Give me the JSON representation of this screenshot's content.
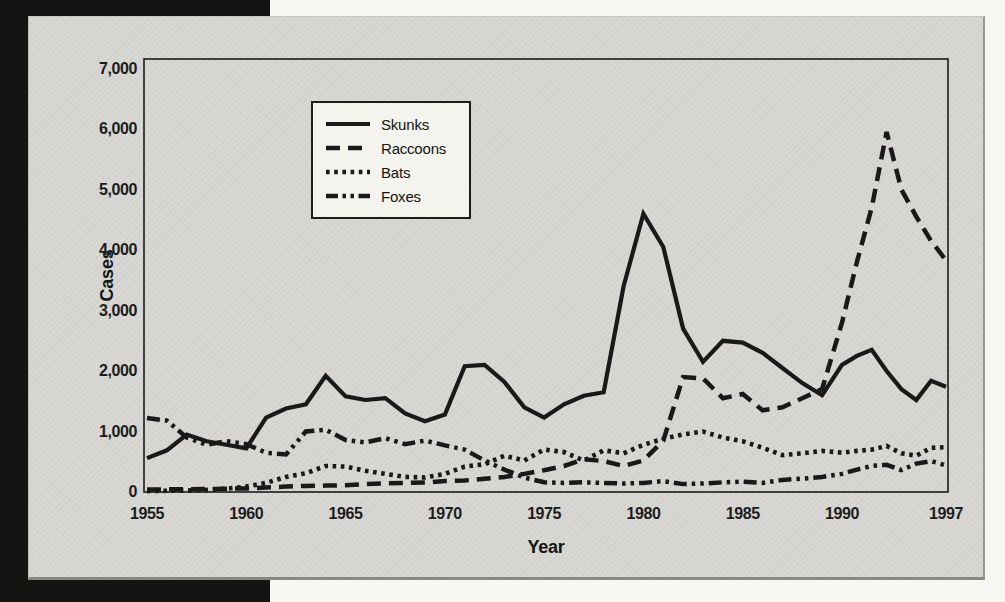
{
  "axis_titles": {
    "y": "Cases",
    "x": "Year"
  },
  "panel": {
    "background": "#d7d6d2",
    "line_color": "#191919",
    "legend_background": "#f4f3ee"
  },
  "chart_data": {
    "type": "line",
    "title": "",
    "xlabel": "Year",
    "ylabel": "Cases",
    "ylim": [
      0,
      7000
    ],
    "grid": false,
    "legend_position": "top-left-inside",
    "y_tick_labels": [
      "0",
      "1,000",
      "2,000",
      "3,000",
      "4,000",
      "5,000",
      "6,000",
      "7,000"
    ],
    "x_tick_labels": [
      "1955",
      "1960",
      "1965",
      "1970",
      "1975",
      "1980",
      "1985",
      "1990",
      "1997"
    ],
    "x_tick_years": [
      1955,
      1960,
      1965,
      1970,
      1975,
      1980,
      1985,
      1990,
      1997
    ],
    "x": [
      1955,
      1956,
      1957,
      1958,
      1959,
      1960,
      1961,
      1962,
      1963,
      1964,
      1965,
      1966,
      1967,
      1968,
      1969,
      1970,
      1971,
      1972,
      1973,
      1974,
      1975,
      1976,
      1977,
      1978,
      1979,
      1980,
      1981,
      1982,
      1983,
      1984,
      1985,
      1986,
      1987,
      1988,
      1989,
      1990,
      1991,
      1992,
      1993,
      1994,
      1995,
      1996,
      1997
    ],
    "series": [
      {
        "name": "Skunks",
        "line_style": "solid",
        "values": [
          560,
          690,
          950,
          840,
          780,
          720,
          1230,
          1380,
          1450,
          1920,
          1580,
          1520,
          1550,
          1300,
          1170,
          1280,
          2080,
          2100,
          1820,
          1400,
          1230,
          1450,
          1590,
          1650,
          3400,
          4600,
          4050,
          2700,
          2150,
          2500,
          2470,
          2300,
          2050,
          1800,
          1600,
          2100,
          2250,
          2350,
          2000,
          1700,
          1520,
          1840,
          1740
        ]
      },
      {
        "name": "Raccoons",
        "line_style": "dashed",
        "values": [
          40,
          45,
          45,
          50,
          55,
          60,
          75,
          90,
          100,
          105,
          110,
          130,
          145,
          150,
          155,
          180,
          190,
          220,
          250,
          300,
          360,
          430,
          540,
          510,
          430,
          520,
          850,
          1900,
          1880,
          1550,
          1620,
          1350,
          1400,
          1550,
          1700,
          2800,
          3800,
          4700,
          5950,
          5000,
          4550,
          4150,
          3830
        ]
      },
      {
        "name": "Bats",
        "line_style": "dotted",
        "values": [
          15,
          20,
          25,
          35,
          55,
          90,
          150,
          250,
          310,
          430,
          420,
          350,
          300,
          250,
          240,
          300,
          420,
          460,
          600,
          520,
          700,
          660,
          520,
          690,
          640,
          780,
          880,
          950,
          1000,
          900,
          840,
          730,
          610,
          640,
          680,
          650,
          680,
          700,
          760,
          640,
          600,
          730,
          740
        ]
      },
      {
        "name": "Foxes",
        "line_style": "dash-dot-dot",
        "values": [
          1225,
          1180,
          900,
          780,
          840,
          790,
          650,
          620,
          1000,
          1030,
          860,
          820,
          890,
          790,
          850,
          770,
          700,
          520,
          370,
          240,
          160,
          150,
          160,
          150,
          140,
          150,
          180,
          130,
          140,
          160,
          170,
          150,
          200,
          220,
          250,
          300,
          370,
          430,
          450,
          360,
          470,
          510,
          440
        ]
      }
    ]
  }
}
